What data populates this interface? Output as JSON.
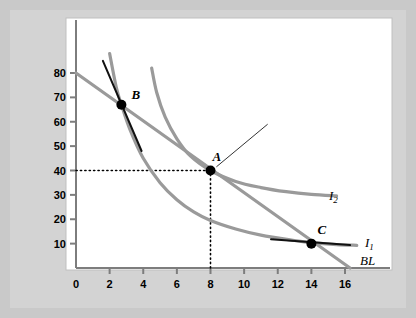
{
  "figure": {
    "background_color": "#c9c9c9",
    "plot_background_color": "#ffffff",
    "curve_color": "#9a9a9a",
    "tangent_color": "#111111",
    "point_color": "#000000"
  },
  "annotation": {
    "text": "At the optimal consumption bundle, MRS is equal to the relative price."
  },
  "chart_data": {
    "type": "line",
    "title": "",
    "xlabel": "Quantity of rooms",
    "ylabel": "Quantity of restaurant meals",
    "xlim": [
      0,
      17
    ],
    "ylim": [
      0,
      88
    ],
    "xticks": [
      0,
      2,
      4,
      6,
      8,
      10,
      12,
      14,
      16
    ],
    "xticklabels": [
      "0",
      "2",
      "4",
      "6",
      "8",
      "10",
      "12",
      "14",
      "16"
    ],
    "yticks": [
      10,
      20,
      30,
      40,
      50,
      60,
      70,
      80
    ],
    "yticklabels": [
      "10",
      "20",
      "30",
      "40",
      "50",
      "60",
      "70",
      "80"
    ],
    "grid": false,
    "legend_position": "inline-right",
    "series": [
      {
        "name": "BL",
        "label": "BL",
        "kind": "budget-line",
        "description": "Budget line from (0,80) to (16.3,0)",
        "points": [
          [
            0,
            80
          ],
          [
            16.3,
            0
          ]
        ]
      },
      {
        "name": "I1",
        "label": "I₁",
        "kind": "indifference-curve",
        "description": "Lower indifference curve through B and C",
        "points": [
          [
            2.0,
            88
          ],
          [
            2.4,
            74
          ],
          [
            2.7,
            67
          ],
          [
            3.2,
            57
          ],
          [
            4.0,
            45
          ],
          [
            5.0,
            35
          ],
          [
            6.0,
            28
          ],
          [
            7.0,
            23
          ],
          [
            8.0,
            19.5
          ],
          [
            9.5,
            16
          ],
          [
            11.0,
            13.5
          ],
          [
            13.0,
            11.3
          ],
          [
            14.0,
            10.4
          ],
          [
            15.5,
            9.6
          ],
          [
            16.7,
            9.3
          ]
        ]
      },
      {
        "name": "I2",
        "label": "I₂",
        "kind": "indifference-curve",
        "description": "Higher indifference curve tangent to BL at A",
        "points": [
          [
            4.5,
            82
          ],
          [
            4.8,
            72
          ],
          [
            5.3,
            62
          ],
          [
            6.0,
            53
          ],
          [
            6.8,
            46
          ],
          [
            8.0,
            40
          ],
          [
            9.5,
            35.5
          ],
          [
            11.0,
            33
          ],
          [
            12.5,
            31.3
          ],
          [
            14.0,
            30.2
          ],
          [
            15.5,
            29.6
          ]
        ]
      },
      {
        "name": "tangent-at-B",
        "label": "",
        "kind": "tangent-line",
        "description": "Steep tangent to I1 at bundle B",
        "points": [
          [
            1.6,
            85
          ],
          [
            3.9,
            48
          ]
        ]
      },
      {
        "name": "tangent-at-C",
        "label": "",
        "kind": "tangent-line",
        "description": "Flat tangent to I1 at bundle C",
        "points": [
          [
            11.6,
            11.8
          ],
          [
            16.3,
            9.4
          ]
        ]
      }
    ],
    "points": [
      {
        "name": "A",
        "label": "A",
        "x": 8,
        "y": 40,
        "note": "optimal consumption bundle, tangency of BL and I2"
      },
      {
        "name": "B",
        "label": "B",
        "x": 2.7,
        "y": 67,
        "note": "on BL, MRS greater than relative price"
      },
      {
        "name": "C",
        "label": "C",
        "x": 14,
        "y": 10,
        "note": "on BL, MRS less than relative price"
      }
    ],
    "guides": [
      {
        "name": "dotted-horizontal-from-A",
        "from": [
          0,
          40
        ],
        "to": [
          8,
          40
        ],
        "style": "dotted"
      },
      {
        "name": "dotted-vertical-from-A",
        "from": [
          8,
          0
        ],
        "to": [
          8,
          40
        ],
        "style": "dotted"
      }
    ],
    "annotations": [
      {
        "name": "optimal-bundle-callout",
        "text": "At the optimal consumption bundle, MRS is equal to the relative price.",
        "leader_from": [
          8.35,
          41.5
        ],
        "leader_to": [
          11.4,
          59
        ]
      }
    ]
  }
}
